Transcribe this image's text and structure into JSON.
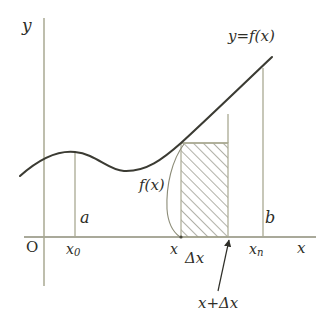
{
  "figure": {
    "type": "calculus-riemann-rectangle-diagram",
    "axes": {
      "y_axis_label": "y",
      "x_axis_label": "x",
      "origin_label": "O"
    },
    "curve": {
      "label": "y=f(x)",
      "description": "smooth curve rising, peaking near x0, dipping to a trough, then increasing steeply to xn"
    },
    "tick_labels": {
      "x0": "x₀",
      "x0_text": "x",
      "x0_sub": "0",
      "xn_text": "x",
      "xn_sub": "n",
      "x": "x"
    },
    "endpoint_labels": {
      "a": "a",
      "b": "b"
    },
    "annotations": {
      "height_label": "f(x)",
      "width_label": "Δx",
      "right_edge_label": "x+Δx"
    },
    "colors": {
      "curve": "#3b3b33",
      "axis": "#8c8c78",
      "gridline": "#a9a992",
      "hatch": "#6f6f5e",
      "text": "#2e2e28",
      "background": "#ffffff"
    },
    "geometry": {
      "x_axis_y": 237,
      "y_axis_x": 44,
      "x0_x": 75,
      "rect_left_x": 181,
      "rect_right_x": 228,
      "rect_top_y": 143,
      "xn_x": 263
    }
  }
}
